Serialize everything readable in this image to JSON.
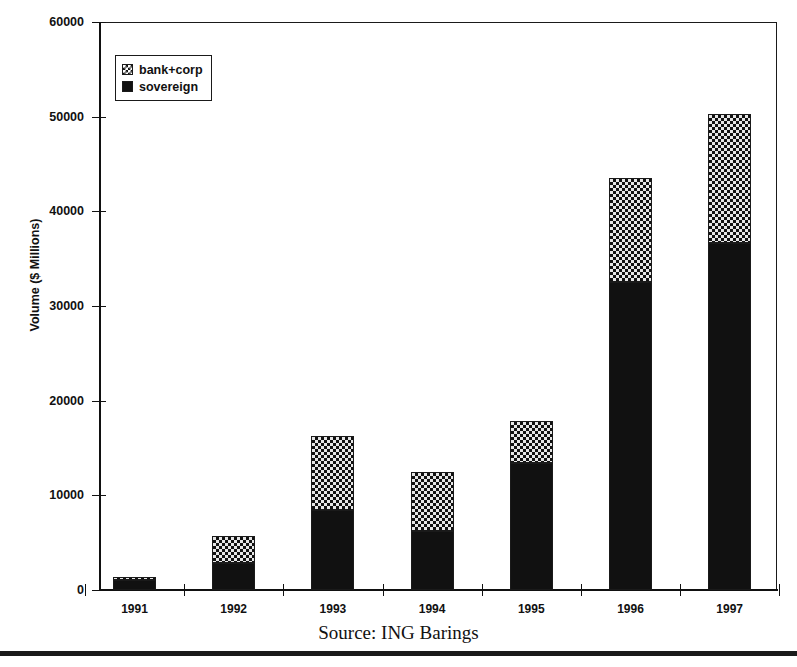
{
  "figure": {
    "caption": "Source: ING Barings",
    "title_remnant": ""
  },
  "legend": {
    "items": [
      {
        "label": "bank+corp",
        "swatch": "checkerboard-pattern-swatch",
        "color": "#e6e6e6"
      },
      {
        "label": "sovereign",
        "swatch": "solid-black-swatch",
        "color": "#111111"
      }
    ]
  },
  "axes": {
    "ylabel": "Volume ($ Millions)",
    "yticks": [
      0,
      10000,
      20000,
      30000,
      40000,
      50000,
      60000
    ],
    "ytick_labels": [
      "0",
      "10000",
      "20000",
      "30000",
      "40000",
      "50000",
      "60000"
    ],
    "xtick_labels": [
      "1991",
      "1992",
      "1993",
      "1994",
      "1995",
      "1996",
      "1997"
    ]
  },
  "chart_data": {
    "type": "bar",
    "title": "",
    "subtitle": "",
    "categories": [
      "1991",
      "1992",
      "1993",
      "1994",
      "1995",
      "1996",
      "1997"
    ],
    "series": [
      {
        "name": "sovereign",
        "values": [
          1100,
          2800,
          8500,
          6200,
          13400,
          32500,
          36700
        ]
      },
      {
        "name": "bank+corp",
        "values": [
          300,
          2900,
          7800,
          6300,
          4400,
          11000,
          13600
        ]
      }
    ],
    "totals": [
      1400,
      5700,
      16300,
      12500,
      17800,
      43500,
      50300
    ],
    "stacked": true,
    "xlabel": "",
    "ylabel": "Volume ($ Millions)",
    "ylim": [
      0,
      60000
    ],
    "ytick_step": 10000,
    "grid": false,
    "legend_position": "upper-left-inside",
    "annotation": "Source: ING Barings"
  }
}
